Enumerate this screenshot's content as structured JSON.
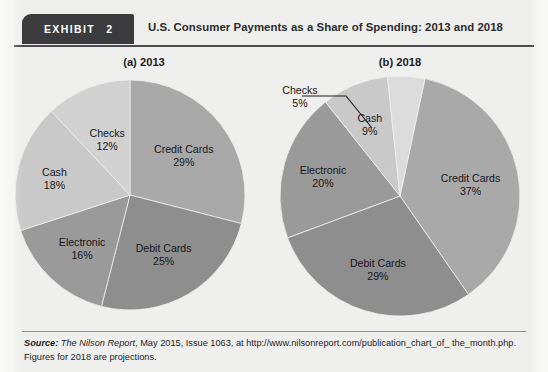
{
  "header": {
    "exhibit_word": "EXHIBIT",
    "exhibit_number": "2",
    "title": "U.S. Consumer Payments as a Share of Spending: 2013 and 2018",
    "badge_color": "#3b3b3d",
    "rule_color": "#4a4a4c"
  },
  "source": {
    "label": "Source:",
    "publication": "The Nilson Report",
    "rest_line1": ", May 2015, Issue 1063, at http://www.nilsonreport.com/publication_chart_of_",
    "rest_line2": "the_month.php. Figures for 2018 are projections."
  },
  "chart_data": [
    {
      "type": "pie",
      "title": "(a) 2013",
      "id": "pie-2013",
      "start_angle_deg": 0,
      "legend": "none",
      "categories": [
        "Credit Cards",
        "Debit Cards",
        "Electronic",
        "Cash",
        "Checks"
      ],
      "values": [
        29,
        25,
        16,
        18,
        12
      ],
      "value_labels": [
        "29%",
        "25%",
        "16%",
        "18%",
        "12%"
      ],
      "colors": [
        "#a9a9a9",
        "#8e8e8e",
        "#9a9a9a",
        "#c9c9c9",
        "#d2d2d2"
      ],
      "labels_inside": [
        true,
        true,
        true,
        true,
        true
      ],
      "units": "percent of consumer spending"
    },
    {
      "type": "pie",
      "title": "(b) 2018",
      "id": "pie-2018",
      "start_angle_deg": 12,
      "legend": "none",
      "categories": [
        "Credit Cards",
        "Debit Cards",
        "Electronic",
        "Cash",
        "Checks"
      ],
      "values": [
        37,
        29,
        20,
        9,
        5
      ],
      "value_labels": [
        "37%",
        "29%",
        "20%",
        "9%",
        "5%"
      ],
      "colors": [
        "#a9a9a9",
        "#8e8e8e",
        "#9a9a9a",
        "#c9c9c9",
        "#dcdcdc"
      ],
      "labels_inside": [
        true,
        true,
        true,
        true,
        false
      ],
      "callout": {
        "category": "Checks",
        "value_label": "5%"
      },
      "units": "percent of consumer spending"
    }
  ]
}
